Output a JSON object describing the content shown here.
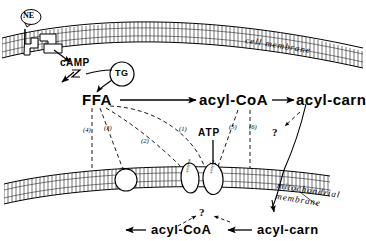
{
  "figure": {
    "type": "biological-schematic",
    "title_visible": false,
    "background_color": "#ffffff",
    "line_color": "#000000"
  },
  "cell_membrane": {
    "label": "cell membrane",
    "receptor_ligand": "NE",
    "second_messenger": "cAMP"
  },
  "cytosol": {
    "lipid_droplet": "TG",
    "metabolites": {
      "ffa": "FFA",
      "acyl_coa": "acyl-CoA",
      "acyl_carn": "acyl-carn"
    },
    "cofactor": "ATP",
    "question_mark": "?"
  },
  "mechanism_labels": [
    {
      "id": "1",
      "text": "(1)"
    },
    {
      "id": "2",
      "text": "(2)"
    },
    {
      "id": "3",
      "text": "(3)"
    },
    {
      "id": "4",
      "text": "(4)"
    },
    {
      "id": "5",
      "text": "(5)"
    },
    {
      "id": "6",
      "text": "(6)"
    }
  ],
  "mitochondrion": {
    "label_line1": "mitochondrial",
    "label_line2": "membrane",
    "transporter_1": "enzyme",
    "transporter_2": "enzyme"
  },
  "matrix": {
    "acyl_coa": "acyl-CoA",
    "acyl_carn": "acyl-carn",
    "question_mark": "?"
  }
}
